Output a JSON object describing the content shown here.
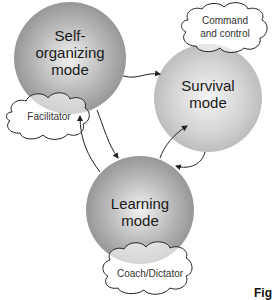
{
  "diagram": {
    "nodes": [
      {
        "id": "self-organizing",
        "label_line1": "Self-",
        "label_line2": "organizing",
        "label_line3": "mode"
      },
      {
        "id": "survival",
        "label_line1": "Survival",
        "label_line2": "mode"
      },
      {
        "id": "learning",
        "label_line1": "Learning",
        "label_line2": "mode"
      }
    ],
    "roles": {
      "facilitator": "Facilitator",
      "command_line1": "Command",
      "command_line2": "and control",
      "coach": "Coach/Dictator"
    },
    "edges": [
      {
        "from": "self-organizing",
        "to": "survival"
      },
      {
        "from": "self-organizing",
        "to": "learning"
      },
      {
        "from": "learning",
        "to": "self-organizing"
      },
      {
        "from": "learning",
        "to": "survival"
      },
      {
        "from": "survival",
        "to": "learning"
      }
    ],
    "caption_fragment": "Fig"
  }
}
